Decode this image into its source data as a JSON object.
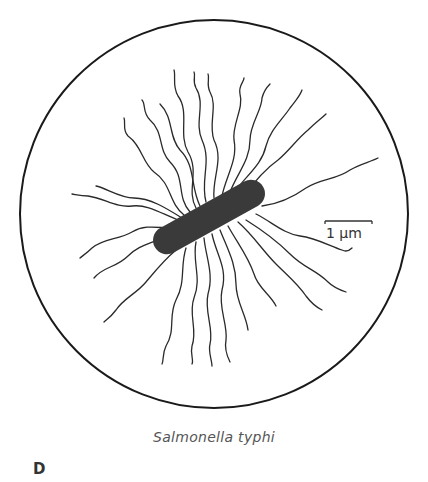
{
  "figure": {
    "caption": "Salmonella typhi",
    "panel_label": "D",
    "scale_bar": {
      "label": "1 μm"
    },
    "colors": {
      "outline": "#1a1a1a",
      "cell_body": "#3a3a3a",
      "flagella": "#2a2a2a",
      "caption": "#555555"
    }
  }
}
